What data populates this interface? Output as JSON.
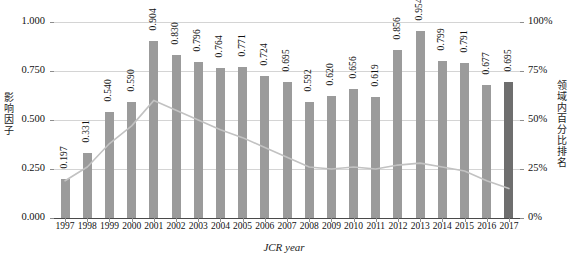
{
  "chart_data": {
    "type": "bar",
    "title": "",
    "xlabel": "JCR year",
    "ylabel": "影响因子",
    "ylabel_right": "领域内百分比排名",
    "categories": [
      "1997",
      "1998",
      "1999",
      "2000",
      "2001",
      "2002",
      "2003",
      "2004",
      "2005",
      "2006",
      "2007",
      "2008",
      "2009",
      "2010",
      "2011",
      "2012",
      "2013",
      "2014",
      "2015",
      "2016",
      "2017"
    ],
    "series": [
      {
        "name": "影响因子",
        "type": "bar",
        "axis": "left",
        "values": [
          0.197,
          0.331,
          0.54,
          0.59,
          0.904,
          0.83,
          0.796,
          0.764,
          0.771,
          0.724,
          0.695,
          0.592,
          0.62,
          0.656,
          0.619,
          0.856,
          0.954,
          0.799,
          0.791,
          0.677,
          0.695
        ],
        "labels": [
          "0.197",
          "0.331",
          "0.540",
          "0.590",
          "0.904",
          "0.830",
          "0.796",
          "0.764",
          "0.771",
          "0.724",
          "0.695",
          "0.592",
          "0.620",
          "0.656",
          "0.619",
          "0.856",
          "0.954",
          "0.799",
          "0.791",
          "0.677",
          "0.695"
        ],
        "color": "#9b9b9b",
        "highlight_index": 20,
        "highlight_color": "#6e6e6e"
      },
      {
        "name": "领域内百分比排名",
        "type": "line",
        "axis": "right",
        "values": [
          19,
          26,
          38,
          47,
          60,
          55,
          50,
          45,
          41,
          36,
          31,
          26,
          25,
          26,
          25,
          27,
          28,
          26,
          24,
          19,
          15
        ],
        "color": "#c2c2c2"
      }
    ],
    "ylim": [
      0.0,
      1.0
    ],
    "yticks": [
      0.0,
      0.25,
      0.5,
      0.75,
      1.0
    ],
    "ytick_labels": [
      "0.000",
      "0.250",
      "0.500",
      "0.750",
      "1.000"
    ],
    "ylim_right": [
      0,
      100
    ],
    "yticks_right": [
      0,
      25,
      50,
      75,
      100
    ],
    "ytick_labels_right": [
      "0%",
      "25%",
      "50%",
      "75%",
      "100%"
    ],
    "grid": true,
    "legend": "none"
  }
}
